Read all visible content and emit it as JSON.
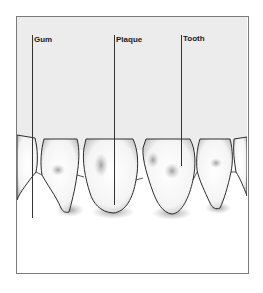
{
  "diagram": {
    "title": "",
    "labels": [
      {
        "id": "gum",
        "text": "Gum"
      },
      {
        "id": "plaque",
        "text": "Plaque"
      },
      {
        "id": "tooth",
        "text": "Tooth"
      }
    ],
    "colors": {
      "background_upper": "#ececec",
      "background_lower": "#ffffff",
      "outline": "#2e2e2e",
      "leader_line": "#333333",
      "frame": "#7a7a7a",
      "plaque_shade": "#9a9a9a"
    }
  }
}
